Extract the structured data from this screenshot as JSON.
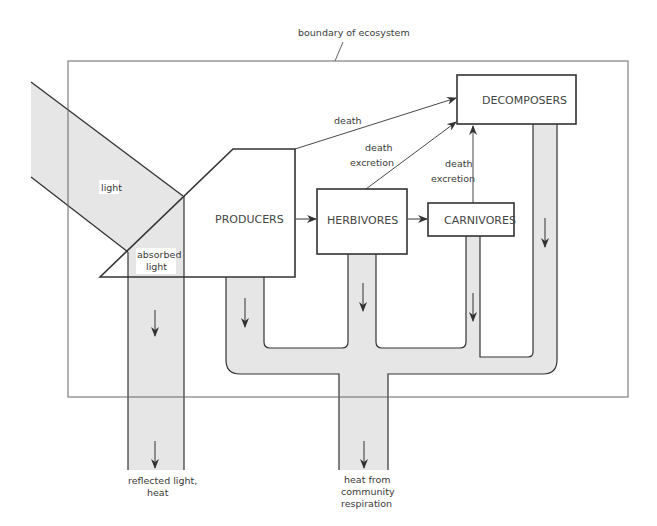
{
  "diagram": {
    "boundary_label": "boundary of ecosystem",
    "nodes": {
      "producers": "PRODUCERS",
      "herbivores": "HERBIVORES",
      "carnivores": "CARNIVORES",
      "decomposers": "DECOMPOSERS"
    },
    "labels": {
      "light": "light",
      "absorbed_1": "absorbed",
      "absorbed_2": "light",
      "death_producers": "death",
      "herb_death": "death",
      "herb_excretion": "excretion",
      "carn_death": "death",
      "carn_excretion": "excretion",
      "reflected_1": "reflected light,",
      "reflected_2": "heat",
      "heat_1": "heat from",
      "heat_2": "community",
      "heat_3": "respiration"
    },
    "colors": {
      "flow_fill": "#e6e6e6",
      "line": "#333333",
      "boundary": "#666666"
    },
    "edges": [
      {
        "from": "producers",
        "to": "herbivores",
        "label": ""
      },
      {
        "from": "herbivores",
        "to": "carnivores",
        "label": ""
      },
      {
        "from": "producers",
        "to": "decomposers",
        "label": "death"
      },
      {
        "from": "herbivores",
        "to": "decomposers",
        "label": "death excretion"
      },
      {
        "from": "carnivores",
        "to": "decomposers",
        "label": "death excretion"
      },
      {
        "from": "light",
        "to": "producers",
        "label": "absorbed light"
      },
      {
        "from": "light",
        "to": "outside",
        "label": "reflected light, heat"
      },
      {
        "from": "community",
        "to": "outside",
        "label": "heat from community respiration"
      }
    ]
  }
}
